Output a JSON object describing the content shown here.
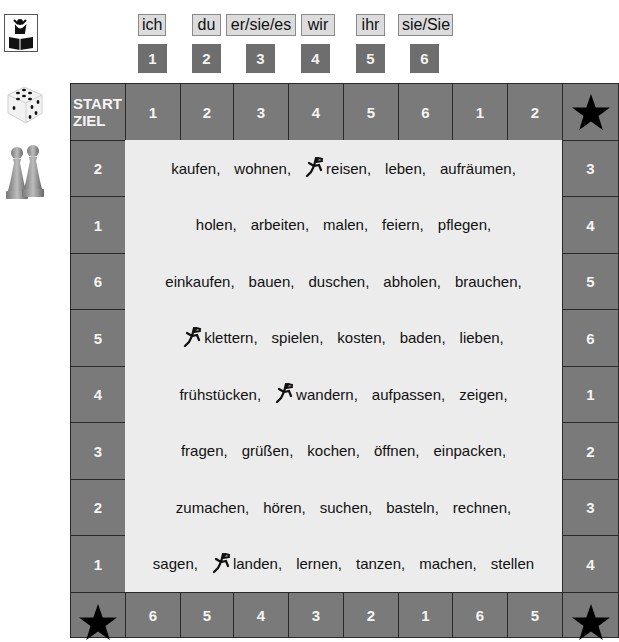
{
  "sidebar": {
    "icons": [
      "game-book-icon",
      "dice-icon",
      "pawns-icon"
    ]
  },
  "pronouns": [
    {
      "label": "ich",
      "number": "1"
    },
    {
      "label": "du",
      "number": "2"
    },
    {
      "label": "er/sie/es",
      "number": "3"
    },
    {
      "label": "wir",
      "number": "4"
    },
    {
      "label": "ihr",
      "number": "5"
    },
    {
      "label": "sie/Sie",
      "number": "6"
    }
  ],
  "board": {
    "start_label_line1": "START",
    "start_label_line2": "ZIEL",
    "top_row": [
      "1",
      "2",
      "3",
      "4",
      "5",
      "6",
      "1",
      "2"
    ],
    "right_col": [
      "3",
      "4",
      "5",
      "6",
      "1",
      "2",
      "3",
      "4"
    ],
    "bottom_row": [
      "6",
      "5",
      "4",
      "3",
      "2",
      "1",
      "6",
      "5"
    ],
    "left_col": [
      "2",
      "1",
      "6",
      "5",
      "4",
      "3",
      "2",
      "1"
    ],
    "corner_icon": "star-icon",
    "colors": {
      "cell": "#7a7a7a",
      "center": "#ececec",
      "star": "#000000",
      "pronoun_bg": "#dcdcdc"
    }
  },
  "verbs": [
    [
      {
        "w": "kaufen,"
      },
      {
        "w": "wohnen,"
      },
      {
        "w": "reisen,",
        "runner": true
      },
      {
        "w": "leben,"
      },
      {
        "w": "aufräumen,"
      }
    ],
    [
      {
        "w": "holen,"
      },
      {
        "w": "arbeiten,"
      },
      {
        "w": "malen,"
      },
      {
        "w": "feiern,"
      },
      {
        "w": "pflegen,"
      }
    ],
    [
      {
        "w": "einkaufen,"
      },
      {
        "w": "bauen,"
      },
      {
        "w": "duschen,"
      },
      {
        "w": "abholen,"
      },
      {
        "w": "brauchen,"
      }
    ],
    [
      {
        "w": "klettern,",
        "runner": true
      },
      {
        "w": "spielen,"
      },
      {
        "w": "kosten,"
      },
      {
        "w": "baden,"
      },
      {
        "w": "lieben,"
      }
    ],
    [
      {
        "w": "frühstücken,"
      },
      {
        "w": "wandern,",
        "runner": true
      },
      {
        "w": "aufpassen,"
      },
      {
        "w": "zeigen,"
      }
    ],
    [
      {
        "w": "fragen,"
      },
      {
        "w": "grüßen,"
      },
      {
        "w": "kochen,"
      },
      {
        "w": "öffnen,"
      },
      {
        "w": "einpacken,"
      }
    ],
    [
      {
        "w": "zumachen,"
      },
      {
        "w": "hören,"
      },
      {
        "w": "suchen,"
      },
      {
        "w": "basteln,"
      },
      {
        "w": "rechnen,"
      }
    ],
    [
      {
        "w": "sagen,"
      },
      {
        "w": "landen,",
        "runner": true
      },
      {
        "w": "lernen,"
      },
      {
        "w": "tanzen,"
      },
      {
        "w": "machen,"
      },
      {
        "w": "stellen"
      }
    ]
  ]
}
